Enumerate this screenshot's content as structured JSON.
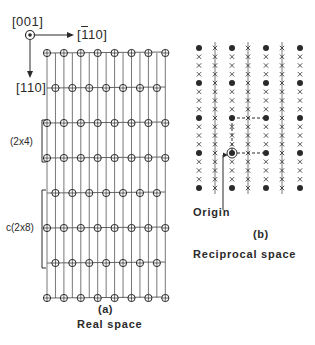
{
  "figure": {
    "panel_a": {
      "axis_labels": {
        "normal": "[001]",
        "horizontal": "[1̄10]",
        "horizontal_parts": {
          "bar": "1",
          "rest": "10"
        },
        "vertical": "[110]"
      },
      "cell_labels": {
        "small": "(2x4)",
        "large": "c(2x8)"
      },
      "panel_label": "(a)",
      "caption": "Real space",
      "lattice": {
        "row_y": [
          53,
          88,
          123,
          158,
          193,
          228,
          263,
          298
        ],
        "row_offsets": [
          0,
          1,
          0,
          0,
          1,
          0,
          1,
          0
        ],
        "col_x_start": 47,
        "col_spacing": 16.9,
        "columns": 8,
        "line_spacing": 8.45
      }
    },
    "panel_b": {
      "origin_label": "Origin",
      "panel_label": "(b)",
      "caption": "Reciprocal space",
      "lattice": {
        "col_x": [
          199,
          215,
          232,
          248,
          266,
          282,
          300
        ],
        "row_y_start": 48,
        "row_spacing": 8.75,
        "rows": 17,
        "dot_every": 4,
        "streak_columns": [
          1,
          3,
          5
        ]
      }
    },
    "colors": {
      "ink": "#2a2a2a",
      "line": "#555555",
      "background": "#ffffff"
    }
  }
}
